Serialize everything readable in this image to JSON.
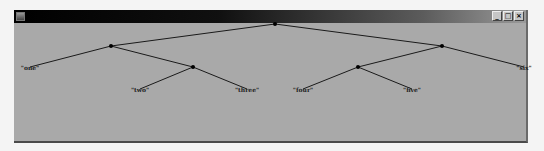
{
  "window": {
    "title": "",
    "controls": {
      "minimize": "_",
      "maximize": "□",
      "close": "×"
    }
  },
  "tree": {
    "nodes": [
      {
        "id": "root",
        "x": 275,
        "y": 24
      },
      {
        "id": "l1",
        "x": 111,
        "y": 46
      },
      {
        "id": "l2",
        "x": 193,
        "y": 67
      },
      {
        "id": "r1",
        "x": 442,
        "y": 46
      },
      {
        "id": "r2",
        "x": 358,
        "y": 67
      }
    ],
    "edges": [
      [
        "root",
        "l1"
      ],
      [
        "root",
        "r1"
      ],
      [
        "l1",
        "one"
      ],
      [
        "l1",
        "l2"
      ],
      [
        "l2",
        "two"
      ],
      [
        "l2",
        "three"
      ],
      [
        "r1",
        "r2"
      ],
      [
        "r1",
        "six"
      ],
      [
        "r2",
        "four"
      ],
      [
        "r2",
        "five"
      ]
    ],
    "leaves": [
      {
        "id": "one",
        "label": "\"one\"",
        "x": 30,
        "y": 70
      },
      {
        "id": "two",
        "label": "\"two\"",
        "x": 140,
        "y": 92
      },
      {
        "id": "three",
        "label": "\"three\"",
        "x": 247,
        "y": 92
      },
      {
        "id": "four",
        "label": "\"four\"",
        "x": 303,
        "y": 92
      },
      {
        "id": "five",
        "label": "\"five\"",
        "x": 412,
        "y": 92
      },
      {
        "id": "six",
        "label": "\"six\"",
        "x": 524,
        "y": 70
      }
    ]
  }
}
